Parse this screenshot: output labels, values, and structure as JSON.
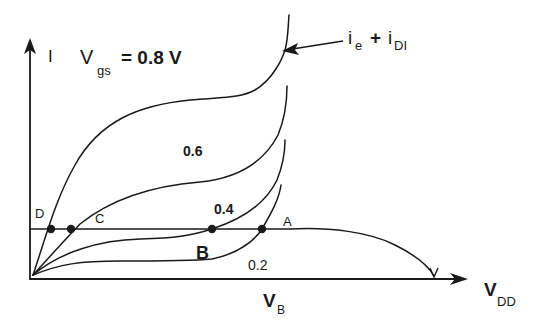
{
  "diagram": {
    "y_axis_label": "I",
    "x_axis_label_main": "V",
    "x_axis_label_sub": "DD",
    "vb_label_main": "V",
    "vb_label_sub": "B",
    "vgs_label": {
      "main": "V",
      "sub": "gs",
      "value": "= 0.8 V"
    },
    "annotation": {
      "part1": "i",
      "part1_sub": "e",
      "plus": "+",
      "part2": "i",
      "part2_sub": "DI"
    },
    "curves": [
      {
        "vgs": "0.8",
        "label": ""
      },
      {
        "vgs": "0.6",
        "label": "0.6"
      },
      {
        "vgs": "0.4",
        "label": "0.4"
      },
      {
        "vgs": "0.2",
        "label": "0.2"
      }
    ],
    "points": [
      {
        "id": "D",
        "label": "D"
      },
      {
        "id": "C",
        "label": "C"
      },
      {
        "id": "B",
        "label": "B"
      },
      {
        "id": "A",
        "label": "A"
      }
    ]
  }
}
